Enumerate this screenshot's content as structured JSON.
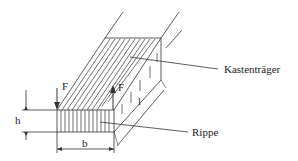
{
  "diagram": {
    "labels": {
      "box_girder": "Kastenträger",
      "rib": "Rippe",
      "force_left": "F",
      "force_right": "F",
      "height": "h",
      "width": "b",
      "length": "l"
    },
    "colors": {
      "line": "#333333",
      "background": "#ffffff"
    }
  }
}
